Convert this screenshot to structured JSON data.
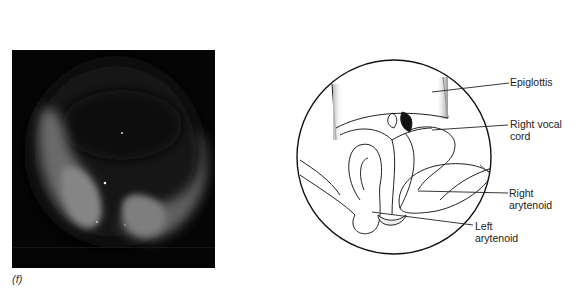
{
  "figure": {
    "panel_label": "(f)",
    "photo": {
      "description": "laryngoscopic-photograph"
    },
    "diagram": {
      "labels": {
        "epiglottis": "Epiglottis",
        "right_vocal_cord_line1": "Right vocal",
        "right_vocal_cord_line2": "cord",
        "right_arytenoid_line1": "Right",
        "right_arytenoid_line2": "arytenoid",
        "left_arytenoid_line1": "Left",
        "left_arytenoid_line2": "arytenoid"
      }
    }
  }
}
